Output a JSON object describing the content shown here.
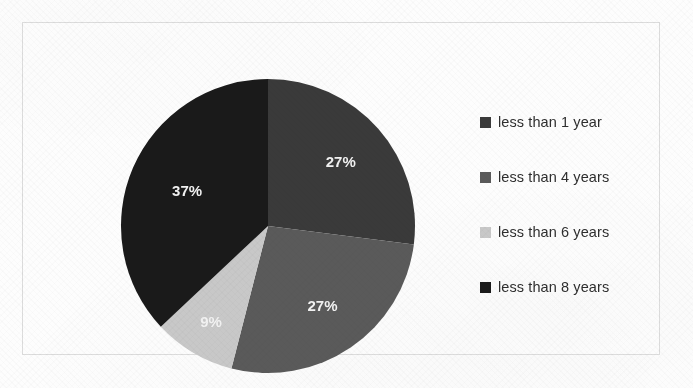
{
  "chart_data": {
    "type": "pie",
    "title": "",
    "subtitle": "",
    "xlabel": "",
    "ylabel": "",
    "grid": false,
    "legend_position": "right",
    "start_angle_deg": 0,
    "direction": "clockwise",
    "categories": [
      "less than 1 year",
      "less than 4 years",
      "less than 6 years",
      "less than 8 years"
    ],
    "values": [
      27,
      27,
      9,
      37
    ],
    "value_unit": "%",
    "data_labels": [
      "27%",
      "27%",
      "9%",
      "37%"
    ],
    "colors": [
      "#3a3a3a",
      "#5a5a5a",
      "#c8c8c8",
      "#1a1a1a"
    ],
    "slices": [
      {
        "label": "less than 1 year",
        "value": 27,
        "data_label": "27%",
        "color": "#3a3a3a",
        "start_deg": 0,
        "end_deg": 97.2
      },
      {
        "label": "less than 4 years",
        "value": 27,
        "data_label": "27%",
        "color": "#5a5a5a",
        "start_deg": 97.2,
        "end_deg": 194.4
      },
      {
        "label": "less than 6 years",
        "value": 9,
        "data_label": "9%",
        "color": "#c8c8c8",
        "start_deg": 194.4,
        "end_deg": 226.8
      },
      {
        "label": "less than 8 years",
        "value": 37,
        "data_label": "37%",
        "color": "#1a1a1a",
        "start_deg": 226.8,
        "end_deg": 360
      }
    ]
  },
  "legend": {
    "items": [
      {
        "label": "less than 1 year",
        "color": "#3a3a3a",
        "marker": "square-marker"
      },
      {
        "label": "less than 4 years",
        "color": "#5a5a5a",
        "marker": "square-marker"
      },
      {
        "label": "less than 6 years",
        "color": "#c8c8c8",
        "marker": "square-marker"
      },
      {
        "label": "less than 8 years",
        "color": "#1a1a1a",
        "marker": "square-marker"
      }
    ]
  },
  "colors": {
    "slice_1": "#3a3a3a",
    "slice_2": "#5a5a5a",
    "slice_3": "#c8c8c8",
    "slice_4": "#1a1a1a",
    "data_label_text": "#f2f2f2",
    "legend_text": "#2e2e2e",
    "frame_border": "#dcdcdc",
    "page_background": "#fdfdfd"
  }
}
